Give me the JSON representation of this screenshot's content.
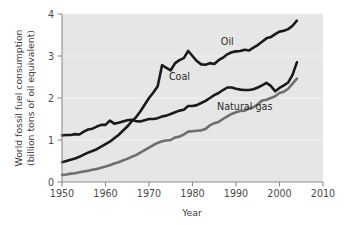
{
  "chart_data": {
    "type": "line",
    "title": "",
    "xlabel": "Year",
    "ylabel": "World fossil fuel consumption (billion tons of oil equivalent)",
    "ylabel_line1": "World fossil fuel consumption",
    "ylabel_line2": "(billion tons of oil equivalent)",
    "xlim": [
      1950,
      2010
    ],
    "ylim": [
      0,
      4
    ],
    "xticks": [
      1950,
      1960,
      1970,
      1980,
      1990,
      2000,
      2010
    ],
    "xtick_labels": [
      "1950",
      "1960",
      "1970",
      "1980",
      "1990",
      "2000",
      "2010"
    ],
    "yticks": [
      0,
      1,
      2,
      3,
      4
    ],
    "ytick_labels": [
      "0",
      "1",
      "2",
      "3",
      "4"
    ],
    "grid": true,
    "grid_axis": "y",
    "legend_position": "inline-annotations",
    "plot_background": "#e6e6e6",
    "series": [
      {
        "name": "Oil",
        "color": "#1a1a1a",
        "stroke_width": 2.6,
        "label_x": 1988,
        "label_y": 3.26,
        "x": [
          1950,
          1951,
          1952,
          1953,
          1954,
          1955,
          1956,
          1957,
          1958,
          1959,
          1960,
          1961,
          1962,
          1963,
          1964,
          1965,
          1966,
          1967,
          1968,
          1969,
          1970,
          1971,
          1972,
          1973,
          1974,
          1975,
          1976,
          1977,
          1978,
          1979,
          1980,
          1981,
          1982,
          1983,
          1984,
          1985,
          1986,
          1987,
          1988,
          1989,
          1990,
          1991,
          1992,
          1993,
          1994,
          1995,
          1996,
          1997,
          1998,
          1999,
          2000,
          2001,
          2002,
          2003,
          2004
        ],
        "y": [
          0.47,
          0.5,
          0.53,
          0.56,
          0.6,
          0.65,
          0.7,
          0.74,
          0.78,
          0.84,
          0.9,
          0.96,
          1.04,
          1.12,
          1.22,
          1.32,
          1.44,
          1.54,
          1.68,
          1.84,
          2.0,
          2.13,
          2.28,
          2.78,
          2.72,
          2.66,
          2.83,
          2.9,
          2.95,
          3.12,
          3.0,
          2.88,
          2.8,
          2.79,
          2.83,
          2.81,
          2.9,
          2.96,
          3.04,
          3.09,
          3.11,
          3.12,
          3.15,
          3.13,
          3.2,
          3.26,
          3.34,
          3.42,
          3.45,
          3.52,
          3.58,
          3.6,
          3.64,
          3.72,
          3.84
        ]
      },
      {
        "name": "Coal",
        "color": "#1a1a1a",
        "stroke_width": 2.6,
        "label_x": 1977,
        "label_y": 2.43,
        "x": [
          1950,
          1951,
          1952,
          1953,
          1954,
          1955,
          1956,
          1957,
          1958,
          1959,
          1960,
          1961,
          1962,
          1963,
          1964,
          1965,
          1966,
          1967,
          1968,
          1969,
          1970,
          1971,
          1972,
          1973,
          1974,
          1975,
          1976,
          1977,
          1978,
          1979,
          1980,
          1981,
          1982,
          1983,
          1984,
          1985,
          1986,
          1987,
          1988,
          1989,
          1990,
          1991,
          1992,
          1993,
          1994,
          1995,
          1996,
          1997,
          1998,
          1999,
          2000,
          2001,
          2002,
          2003,
          2004
        ],
        "y": [
          1.11,
          1.12,
          1.12,
          1.14,
          1.13,
          1.2,
          1.25,
          1.27,
          1.32,
          1.36,
          1.36,
          1.46,
          1.39,
          1.41,
          1.44,
          1.47,
          1.48,
          1.45,
          1.44,
          1.47,
          1.5,
          1.5,
          1.52,
          1.56,
          1.58,
          1.62,
          1.66,
          1.7,
          1.72,
          1.81,
          1.81,
          1.83,
          1.88,
          1.93,
          2.0,
          2.07,
          2.12,
          2.19,
          2.25,
          2.25,
          2.22,
          2.2,
          2.19,
          2.19,
          2.21,
          2.25,
          2.3,
          2.36,
          2.29,
          2.16,
          2.24,
          2.3,
          2.37,
          2.55,
          2.85
        ]
      },
      {
        "name": "Natural gas",
        "color": "#6e6e6e",
        "stroke_width": 2.6,
        "label_x": 1992,
        "label_y": 1.72,
        "x": [
          1950,
          1951,
          1952,
          1953,
          1954,
          1955,
          1956,
          1957,
          1958,
          1959,
          1960,
          1961,
          1962,
          1963,
          1964,
          1965,
          1966,
          1967,
          1968,
          1969,
          1970,
          1971,
          1972,
          1973,
          1974,
          1975,
          1976,
          1977,
          1978,
          1979,
          1980,
          1981,
          1982,
          1983,
          1984,
          1985,
          1986,
          1987,
          1988,
          1989,
          1990,
          1991,
          1992,
          1993,
          1994,
          1995,
          1996,
          1997,
          1998,
          1999,
          2000,
          2001,
          2002,
          2003,
          2004
        ],
        "y": [
          0.17,
          0.18,
          0.2,
          0.21,
          0.23,
          0.25,
          0.27,
          0.29,
          0.31,
          0.34,
          0.37,
          0.4,
          0.44,
          0.47,
          0.51,
          0.55,
          0.6,
          0.64,
          0.7,
          0.76,
          0.82,
          0.88,
          0.93,
          0.97,
          0.99,
          1.0,
          1.06,
          1.08,
          1.13,
          1.2,
          1.21,
          1.22,
          1.23,
          1.26,
          1.35,
          1.4,
          1.43,
          1.5,
          1.56,
          1.62,
          1.66,
          1.69,
          1.7,
          1.75,
          1.78,
          1.85,
          1.94,
          1.96,
          2.0,
          2.04,
          2.12,
          2.15,
          2.22,
          2.34,
          2.46
        ]
      }
    ],
    "annotations": [
      {
        "text": "Oil",
        "x": 1988,
        "y": 3.26
      },
      {
        "text": "Coal",
        "x": 1977,
        "y": 2.43
      },
      {
        "text": "Natural gas",
        "x": 1992,
        "y": 1.72
      }
    ]
  },
  "axes": {
    "x_title": "Year",
    "y_title_line1": "World fossil fuel consumption",
    "y_title_line2": "(billion tons of oil equivalent)"
  }
}
